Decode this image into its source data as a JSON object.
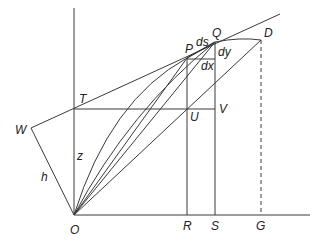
{
  "diagram": {
    "points": {
      "O": {
        "label": "O",
        "x": 74,
        "y": 215
      },
      "T": {
        "label": "T",
        "x": 74,
        "y": 109
      },
      "W": {
        "label": "W",
        "x": 31,
        "y": 128
      },
      "P": {
        "label": "P",
        "x": 187,
        "y": 58
      },
      "Q": {
        "label": "Q",
        "x": 215,
        "y": 42
      },
      "D": {
        "label": "D",
        "x": 261,
        "y": 40
      },
      "U": {
        "label": "U",
        "x": 187,
        "y": 109
      },
      "V": {
        "label": "V",
        "x": 233,
        "y": 109
      },
      "R": {
        "label": "R",
        "x": 187,
        "y": 215
      },
      "S": {
        "label": "S",
        "x": 215,
        "y": 215
      },
      "G": {
        "label": "G",
        "x": 261,
        "y": 215
      }
    },
    "segment_labels": {
      "ds": "ds",
      "dy": "dy",
      "dx": "dx",
      "z": "z",
      "h": "h"
    }
  }
}
